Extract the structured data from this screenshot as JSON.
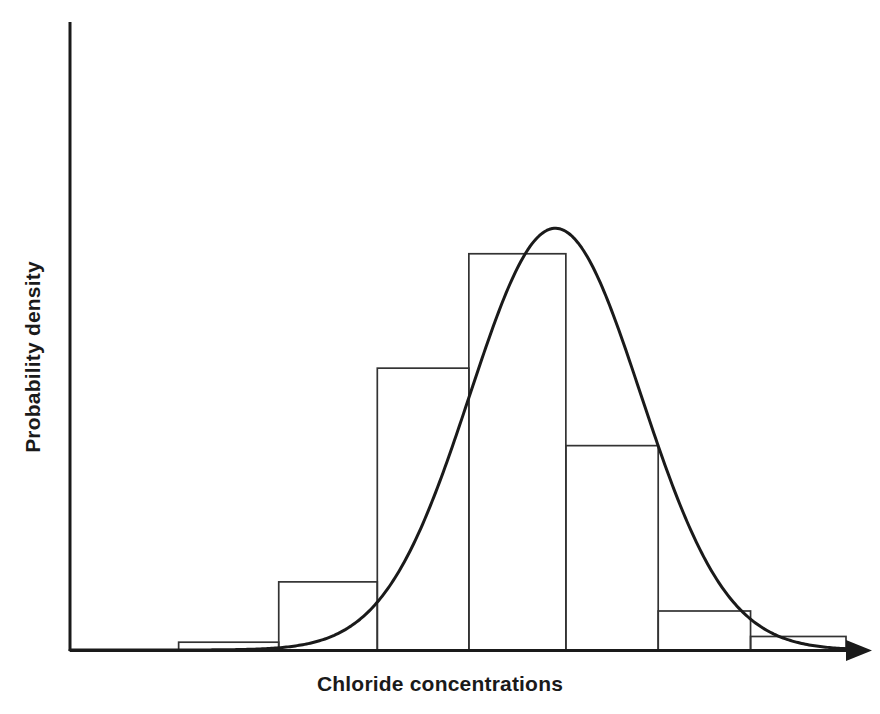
{
  "figure": {
    "width": 880,
    "height": 714,
    "background": "#ffffff",
    "ink_color": "#1a1a1a",
    "bar_stroke_color": "#333333",
    "curve_color": "#1a1a1a"
  },
  "labels": {
    "x_axis_title": "Chloride concentrations",
    "y_axis_title": "Probability density"
  },
  "chart_data": {
    "type": "bar",
    "title": "",
    "subtitle": "",
    "xlabel": "Chloride concentrations",
    "ylabel": "Probability density",
    "grid": false,
    "legend": null,
    "legend_position": "none",
    "axis_style": {
      "x_axis_arrow": true,
      "y_axis_arrow": false,
      "x_tick_labels": [],
      "y_tick_labels": [],
      "ticks_shown": false
    },
    "xlim": [
      0,
      1
    ],
    "ylim": [
      0,
      1
    ],
    "categories": [
      "bin-1",
      "bin-2",
      "bin-3",
      "bin-4",
      "bin-5",
      "bin-6",
      "bin-7"
    ],
    "values": [
      0.015,
      0.131,
      0.542,
      0.762,
      0.393,
      0.075,
      0.026
    ],
    "bin_edges_fraction": [
      0.14,
      0.269,
      0.396,
      0.514,
      0.639,
      0.758,
      0.877,
      1.0
    ],
    "bars": [
      {
        "name": "bin-1",
        "left": 0.14,
        "right": 0.269,
        "height": 0.015
      },
      {
        "name": "bin-2",
        "left": 0.269,
        "right": 0.396,
        "height": 0.131
      },
      {
        "name": "bin-3",
        "left": 0.396,
        "right": 0.514,
        "height": 0.542
      },
      {
        "name": "bin-4",
        "left": 0.514,
        "right": 0.639,
        "height": 0.762
      },
      {
        "name": "bin-5",
        "left": 0.639,
        "right": 0.758,
        "height": 0.393
      },
      {
        "name": "bin-6",
        "left": 0.758,
        "right": 0.877,
        "height": 0.075
      },
      {
        "name": "bin-7",
        "left": 0.877,
        "right": 1.0,
        "height": 0.026
      }
    ],
    "overlay_curve": {
      "name": "normal-density-fit",
      "type": "line",
      "distribution": "normal",
      "mean_fraction": 0.6255,
      "sigma_fraction": 0.11,
      "peak_height": 0.811,
      "stroke_width": 3
    }
  }
}
